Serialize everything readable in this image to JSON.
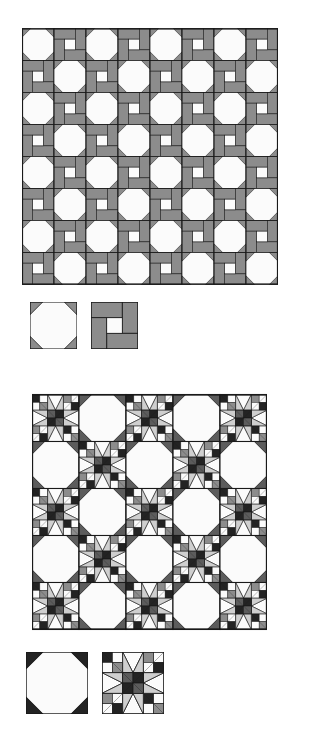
{
  "page": {
    "background": "#ffffff"
  },
  "palette": {
    "background": "#ffffff",
    "outline": "#1a1a1a",
    "medium_gray": "#8c8c8c",
    "light_gray": "#cfcfcf",
    "dark_gray": "#5c5c5c",
    "near_black": "#232323",
    "white_patch": "#fbfbfb"
  },
  "figures": [
    {
      "id": "quilt-top",
      "name": "snowball-and-wrench-quilt",
      "description": "Eight by eight grid alternating Snowball blocks and Wrench blocks",
      "grid": {
        "columns": 8,
        "rows": 8
      },
      "block_size_px": 32,
      "blocks": [
        "snowball",
        "wrench"
      ],
      "colors": [
        "#fbfbfb",
        "#8c8c8c",
        "#1a1a1a"
      ]
    },
    {
      "id": "quilt-bottom",
      "name": "star-and-snowball-quilt",
      "description": "Five by five grid alternating pieced Star blocks and plain Snowball blocks",
      "grid": {
        "columns": 5,
        "rows": 5
      },
      "block_size_px": 47,
      "blocks": [
        "star",
        "snowball"
      ],
      "colors": [
        "#fbfbfb",
        "#cfcfcf",
        "#8c8c8c",
        "#5c5c5c",
        "#232323"
      ]
    }
  ],
  "legends": [
    {
      "id": "legend-top",
      "name": "legend-row-one",
      "swatches": [
        {
          "name": "snowball-block-swatch",
          "block": "snowball",
          "size_px": 47
        },
        {
          "name": "wrench-block-swatch",
          "block": "wrench",
          "size_px": 47
        }
      ]
    },
    {
      "id": "legend-bottom",
      "name": "legend-row-two",
      "swatches": [
        {
          "name": "snowball-block-swatch",
          "block": "snowball",
          "size_px": 62
        },
        {
          "name": "star-block-swatch",
          "block": "star",
          "size_px": 62
        }
      ]
    }
  ]
}
